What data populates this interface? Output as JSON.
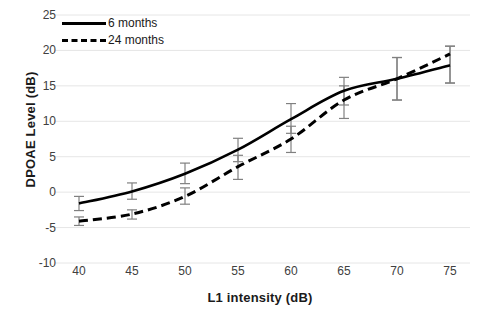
{
  "chart_data": {
    "type": "line",
    "title": "",
    "xlabel": "L1 intensity (dB)",
    "ylabel": "DPOAE Level (dB)",
    "categories": [
      40,
      45,
      50,
      55,
      60,
      65,
      70,
      75
    ],
    "x": [
      40,
      45,
      50,
      55,
      60,
      65,
      70,
      75
    ],
    "xlim": [
      37.5,
      77.5
    ],
    "ylim": [
      -10,
      25
    ],
    "yticks": [
      -10,
      -5,
      0,
      5,
      10,
      15,
      20,
      25
    ],
    "xticks": [
      40,
      45,
      50,
      55,
      60,
      65,
      70,
      75
    ],
    "grid": "horizontal",
    "legend_position": "top-left",
    "series": [
      {
        "name": "6 months",
        "style": "solid",
        "color": "#000000",
        "values": [
          -1.6,
          0.1,
          2.6,
          6.0,
          10.3,
          14.3,
          16.0,
          17.9
        ],
        "err_low": [
          -2.6,
          -1.0,
          1.2,
          4.3,
          8.3,
          12.3,
          13.0,
          15.4
        ],
        "err_high": [
          -0.6,
          1.3,
          4.1,
          7.6,
          12.5,
          16.2,
          19.0,
          20.6
        ]
      },
      {
        "name": "24 months",
        "style": "dashed",
        "color": "#000000",
        "values": [
          -4.1,
          -3.1,
          -0.6,
          3.6,
          7.5,
          13.0,
          16.0,
          19.5
        ],
        "err_low": [
          -4.7,
          -3.8,
          -1.7,
          1.8,
          5.6,
          10.4,
          13.0,
          15.4
        ],
        "err_high": [
          -3.5,
          -2.5,
          0.6,
          5.2,
          9.3,
          15.0,
          19.0,
          20.6
        ]
      }
    ]
  },
  "legend": {
    "items": [
      {
        "label": "6 months"
      },
      {
        "label": "24 months"
      }
    ]
  },
  "axis": {
    "y_title": "DPOAE Level (dB)",
    "x_title": "L1 intensity (dB)",
    "y_tick_labels": [
      "25",
      "20",
      "15",
      "10",
      "5",
      "0",
      "-5",
      "-10"
    ],
    "x_tick_labels": [
      "40",
      "45",
      "50",
      "55",
      "60",
      "65",
      "70",
      "75"
    ]
  },
  "colors": {
    "line": "#000000",
    "error_bar": "#808080",
    "grid": "#e6e6e6",
    "tick_text": "#404040",
    "title_text": "#1a1a1a",
    "background": "#ffffff"
  }
}
